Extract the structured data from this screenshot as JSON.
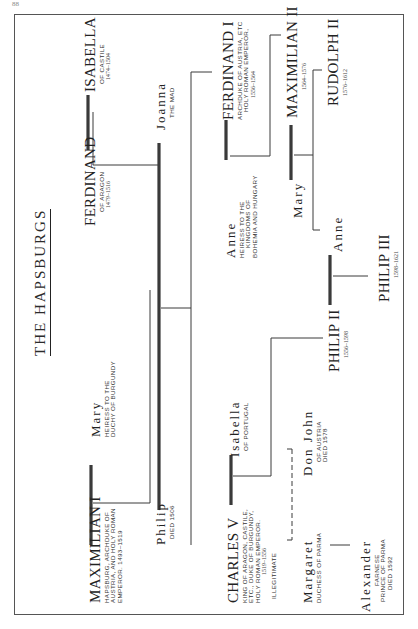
{
  "page": {
    "number": "88"
  },
  "title": "THE HAPSBURGS",
  "people": {
    "isabella_castile": {
      "name": "ISABELLA",
      "lines": [
        "OF CASTILE"
      ],
      "dates": "1474–1504"
    },
    "ferdinand_aragon": {
      "name": "FERDINAND",
      "lines": [
        "OF ARAGON"
      ],
      "dates": "1479–1516"
    },
    "maximilian_i": {
      "name": "MAXIMILIAN  I",
      "lines": [
        "HAPSBURG, ARCHDUKE OF",
        "AUSTRIA, AND HOLY ROMAN",
        "EMPEROR.   1493–1519"
      ]
    },
    "mary_burgundy": {
      "name": "Mary",
      "lines": [
        "HEIRESS TO THE",
        "DUCHY OF BURGUNDY"
      ]
    },
    "joanna": {
      "name": "Joanna",
      "lines": [
        "THE MAD"
      ]
    },
    "philip": {
      "name": "Philip",
      "lines": [
        "DIED  1506"
      ]
    },
    "ferdinand_i": {
      "name": "FERDINAND  I",
      "lines": [
        "ARCHDUKE OF AUSTRIA, ETC",
        "HOLY ROMAN EMPEROR,"
      ],
      "dates": "1556–1564"
    },
    "anne_hungary": {
      "name": "Anne",
      "lines": [
        "HEIRESS TO THE",
        "KINGDOMS OF",
        "BOHEMIA AND HUNGARY"
      ]
    },
    "maximilian_ii": {
      "name": "MAXIMILIAN II",
      "dates": "1564–1576"
    },
    "mary": {
      "name": "Mary"
    },
    "rudolph_ii": {
      "name": "RUDOLPH   II",
      "dates": "1576–1612"
    },
    "anne": {
      "name": "Anne"
    },
    "charles_v": {
      "name": "CHARLES V",
      "lines": [
        "KING OF ARAGON, CASTILE,",
        "ETC., DUKE OF BURGUNDY,",
        "HOLY ROMAN EMPEROR."
      ],
      "dates": "1519–1556"
    },
    "isabella_portugal": {
      "name": "Isabella",
      "lines": [
        "OF PORTUGAL"
      ]
    },
    "philip_ii": {
      "name": "PHILIP  II",
      "dates": "1556–1598"
    },
    "philip_iii": {
      "name": "PHILIP  III",
      "dates": "1598–1621"
    },
    "don_john": {
      "name": "Don  John",
      "lines": [
        "OF AUSTRIA",
        "DIED  1578"
      ]
    },
    "margaret": {
      "name": "Margaret",
      "lines": [
        "DUCHESS OF PARMA"
      ]
    },
    "alexander": {
      "name": "Alexander",
      "lines": [
        "FARNESE",
        "PRINCE OF PARMA",
        "DIED  1592"
      ]
    }
  },
  "annotations": {
    "illegitimate": "ILLEGITIMATE"
  },
  "colors": {
    "line": "#3a3a3a",
    "frame": "#555555",
    "paper": "#ffffff"
  }
}
